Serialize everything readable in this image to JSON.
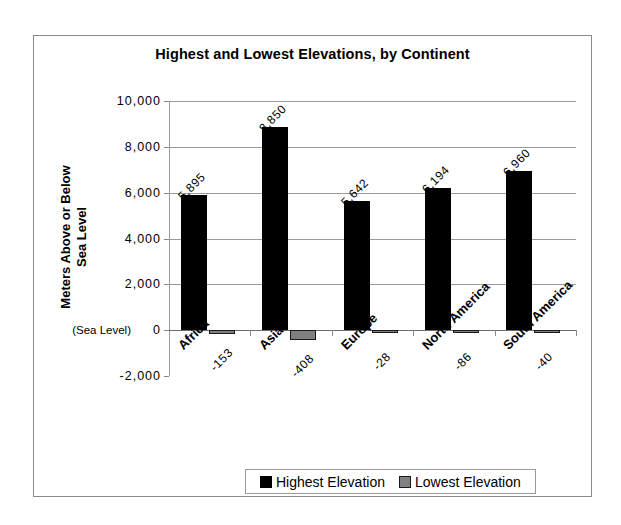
{
  "chart_data": {
    "type": "bar",
    "title": "Highest and Lowest Elevations, by Continent",
    "xlabel": "",
    "ylabel": "Meters Above or Below Sea Level",
    "ylabel_line1": "Meters Above or Below",
    "ylabel_line2": "Sea Level",
    "categories": [
      "Africa",
      "Asia",
      "Europe",
      "North America",
      "South America"
    ],
    "series": [
      {
        "name": "Highest Elevation",
        "color": "#000000",
        "values": [
          5895,
          8850,
          5642,
          6194,
          6960
        ],
        "value_labels": [
          "5,895",
          "8,850",
          "5,642",
          "6,194",
          "6,960"
        ]
      },
      {
        "name": "Lowest Elevation",
        "color": "#808080",
        "values": [
          -153,
          -408,
          -28,
          -86,
          -40
        ],
        "value_labels": [
          "-153",
          "-408",
          "-28",
          "-86",
          "-40"
        ]
      }
    ],
    "ylim": [
      -2000,
      10000
    ],
    "ytick_values": [
      10000,
      8000,
      6000,
      4000,
      2000,
      0,
      -2000
    ],
    "ytick_labels": [
      "10,000",
      "8,000",
      "6,000",
      "4,000",
      "2,000",
      "0",
      "-2,000"
    ],
    "zero_annotation": "(Sea Level)",
    "grid": true,
    "legend_position": "bottom"
  },
  "legend": {
    "entries": [
      {
        "label": "Highest Elevation"
      },
      {
        "label": "Lowest Elevation"
      }
    ]
  }
}
